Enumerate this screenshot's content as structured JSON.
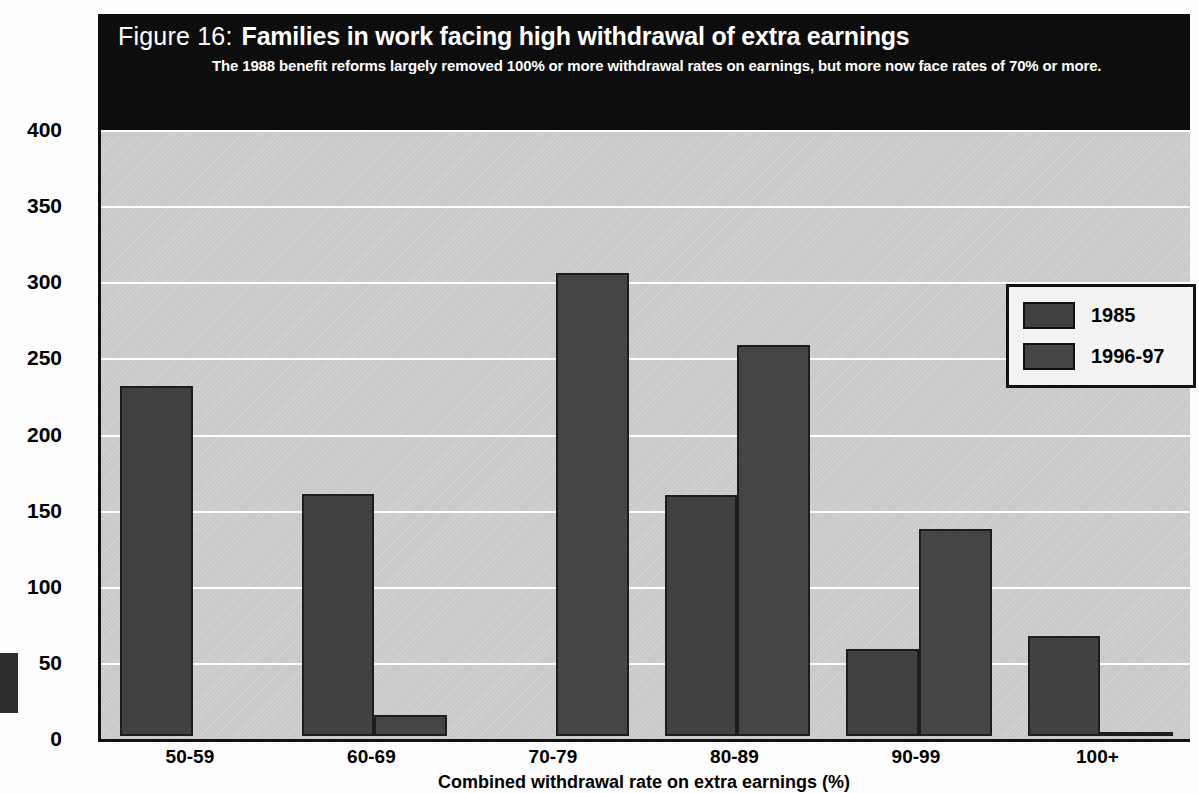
{
  "figure": {
    "number": "Figure 16:",
    "title": "Families in work facing high withdrawal of extra earnings",
    "subtitle": "The 1988 benefit reforms largely removed 100% or more withdrawal rates on earnings, but more now face rates of 70% or more."
  },
  "legend": {
    "position": "top-right",
    "items": [
      {
        "label": "1985",
        "color": "#414141"
      },
      {
        "label": "1996-97",
        "color": "#454545"
      }
    ]
  },
  "colors": {
    "header_background": "#0d0d0d",
    "header_text": "#ffffff",
    "plot_background": "#c9c9c9",
    "gridline": "#ffffff",
    "bar_1985": "#414141",
    "bar_1996_97": "#454545",
    "axis": "#111111"
  },
  "chart_data": {
    "type": "bar",
    "title": "Families in work facing high withdrawal of extra earnings",
    "subtitle": "The 1988 benefit reforms largely removed 100% or more withdrawal rates on earnings, but more now face rates of 70% or more.",
    "xlabel": "Combined withdrawal rate on extra earnings (%)",
    "ylabel": "Families with at least one earner (000s)",
    "categories": [
      "50-59",
      "60-69",
      "70-79",
      "80-89",
      "90-99",
      "100+"
    ],
    "series": [
      {
        "name": "1985",
        "values": [
          230,
          159,
          0,
          158,
          57,
          66
        ]
      },
      {
        "name": "1996-97",
        "values": [
          0,
          14,
          304,
          257,
          136,
          2
        ]
      }
    ],
    "ylim": [
      0,
      400
    ],
    "yticks": [
      0,
      50,
      100,
      150,
      200,
      250,
      300,
      350,
      400
    ],
    "ytick_labels": [
      "0",
      "50",
      "100",
      "150",
      "200",
      "250",
      "300",
      "350",
      "400"
    ],
    "grid": true,
    "legend_position": "upper right"
  }
}
